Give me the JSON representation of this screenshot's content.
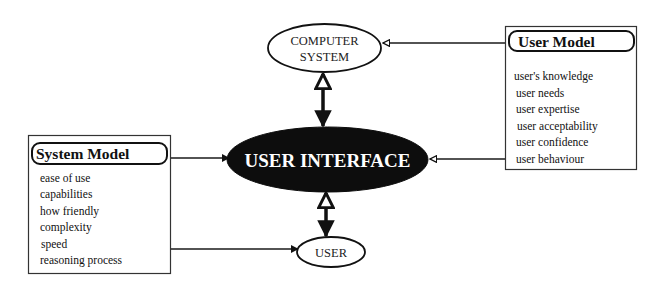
{
  "diagram": {
    "nodes": {
      "computer_system": {
        "line1": "COMPUTER",
        "line2": "SYSTEM"
      },
      "user_interface": {
        "label": "USER INTERFACE"
      },
      "user": {
        "label": "USER"
      }
    },
    "user_model": {
      "title": "User Model",
      "items": [
        "user's knowledge",
        "user needs",
        "user expertise",
        "user acceptability",
        "user confidence",
        "user behaviour"
      ]
    },
    "system_model": {
      "title": "System Model",
      "items": [
        "ease of use",
        "capabilities",
        "how friendly",
        "complexity",
        "speed",
        "reasoning process"
      ]
    },
    "edges": [
      {
        "from": "User Model",
        "to": "COMPUTER SYSTEM",
        "head": "open"
      },
      {
        "from": "User Model",
        "to": "USER INTERFACE",
        "head": "open"
      },
      {
        "from": "System Model",
        "to": "USER INTERFACE",
        "head": "filled"
      },
      {
        "from": "System Model",
        "to": "USER",
        "head": "filled"
      },
      {
        "from": "USER INTERFACE",
        "to": "COMPUTER SYSTEM",
        "head": "open"
      },
      {
        "from": "COMPUTER SYSTEM",
        "to": "USER INTERFACE",
        "head": "filled"
      },
      {
        "from": "USER",
        "to": "USER INTERFACE",
        "head": "open"
      },
      {
        "from": "USER INTERFACE",
        "to": "USER",
        "head": "filled"
      }
    ],
    "colors": {
      "stroke": "#1a1a1a",
      "ui_fill": "#0d0d0d",
      "ui_text": "#ffffff",
      "background": "#ffffff"
    }
  }
}
